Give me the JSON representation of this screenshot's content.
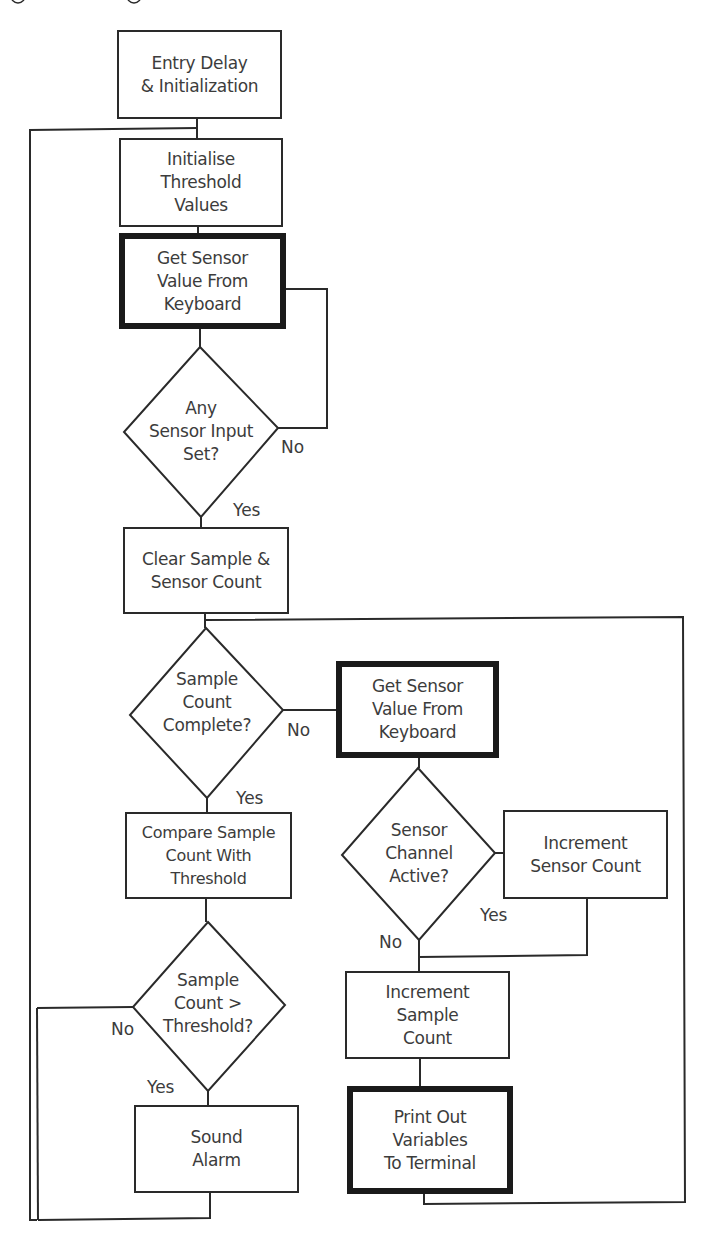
{
  "diagram": {
    "type": "flowchart",
    "nodes": {
      "entry": {
        "label": "Entry Delay\n& Initialization",
        "shape": "process"
      },
      "init_threshold": {
        "label": "Initialise\nThreshold\nValues",
        "shape": "process"
      },
      "get_sensor_1": {
        "label": "Get Sensor\nValue From\nKeyboard",
        "shape": "io-bold"
      },
      "any_input": {
        "label": "Any\nSensor Input\nSet?",
        "shape": "decision"
      },
      "clear_counts": {
        "label": "Clear Sample  &\nSensor Count",
        "shape": "process"
      },
      "sample_complete": {
        "label": "Sample\nCount\nComplete?",
        "shape": "decision"
      },
      "get_sensor_2": {
        "label": "Get Sensor\nValue From\nKeyboard",
        "shape": "io-bold"
      },
      "channel_active": {
        "label": "Sensor\nChannel\nActive?",
        "shape": "decision"
      },
      "inc_sensor": {
        "label": "Increment\nSensor Count",
        "shape": "process"
      },
      "inc_sample": {
        "label": "Increment\nSample\nCount",
        "shape": "process"
      },
      "print_vars": {
        "label": "Print Out\nVariables\nTo Terminal",
        "shape": "io-bold"
      },
      "compare": {
        "label": "Compare Sample\nCount With\nThreshold",
        "shape": "process"
      },
      "over_threshold": {
        "label": "Sample\nCount >\nThreshold?",
        "shape": "decision"
      },
      "sound_alarm": {
        "label": "Sound\nAlarm",
        "shape": "process"
      }
    },
    "branch_labels": {
      "any_input_no": "No",
      "any_input_yes": "Yes",
      "sample_complete_no": "No",
      "sample_complete_yes": "Yes",
      "channel_active_yes": "Yes",
      "channel_active_no": "No",
      "over_threshold_no": "No",
      "over_threshold_yes": "Yes"
    },
    "edges": [
      {
        "from": "entry",
        "to": "init_threshold"
      },
      {
        "from": "init_threshold",
        "to": "get_sensor_1"
      },
      {
        "from": "get_sensor_1",
        "to": "any_input"
      },
      {
        "from": "any_input",
        "to": "get_sensor_1",
        "label": "No"
      },
      {
        "from": "any_input",
        "to": "clear_counts",
        "label": "Yes"
      },
      {
        "from": "clear_counts",
        "to": "sample_complete"
      },
      {
        "from": "sample_complete",
        "to": "get_sensor_2",
        "label": "No"
      },
      {
        "from": "sample_complete",
        "to": "compare",
        "label": "Yes"
      },
      {
        "from": "get_sensor_2",
        "to": "channel_active"
      },
      {
        "from": "channel_active",
        "to": "inc_sensor",
        "label": "Yes"
      },
      {
        "from": "channel_active",
        "to": "inc_sample",
        "label": "No"
      },
      {
        "from": "inc_sensor",
        "to": "inc_sample"
      },
      {
        "from": "inc_sample",
        "to": "print_vars"
      },
      {
        "from": "print_vars",
        "to": "sample_complete"
      },
      {
        "from": "compare",
        "to": "over_threshold"
      },
      {
        "from": "over_threshold",
        "to": "init_threshold",
        "label": "No"
      },
      {
        "from": "over_threshold",
        "to": "sound_alarm",
        "label": "Yes"
      },
      {
        "from": "sound_alarm",
        "to": "init_threshold"
      }
    ]
  }
}
